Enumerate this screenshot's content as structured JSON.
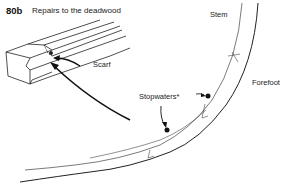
{
  "figure": {
    "number": "80b",
    "title": "Repairs to the deadwood"
  },
  "labels": {
    "scarf": "Scarf",
    "stem": "Stem",
    "forefoot": "Forefoot",
    "stopwaters": "Stopwaters*"
  },
  "colors": {
    "ink": "#111111",
    "background": "#ffffff"
  }
}
